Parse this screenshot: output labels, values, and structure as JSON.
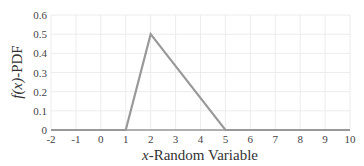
{
  "chart_data": {
    "type": "line",
    "title": "",
    "xlabel": "x-Random Variable",
    "xlabel_var": "x",
    "xlabel_rest": "-Random Variable",
    "ylabel": "f(x)-PDF",
    "ylabel_fn": "f(x)",
    "ylabel_rest": "-PDF",
    "xlim": [
      -2,
      10
    ],
    "ylim": [
      0,
      0.6
    ],
    "x_ticks": [
      "-2",
      "-1",
      "0",
      "1",
      "2",
      "3",
      "4",
      "5",
      "6",
      "7",
      "8",
      "9",
      "10"
    ],
    "y_ticks": [
      "0",
      "0.1",
      "0.2",
      "0.3",
      "0.4",
      "0.5",
      "0.6"
    ],
    "grid": true,
    "legend": null,
    "series": [
      {
        "name": "PDF",
        "color": "#999999",
        "x": [
          -2,
          1,
          2,
          5,
          10
        ],
        "y": [
          0,
          0,
          0.5,
          0,
          0
        ]
      }
    ]
  },
  "colors": {
    "line": "#999999",
    "axis": "#999999",
    "grid": "#ececec"
  }
}
